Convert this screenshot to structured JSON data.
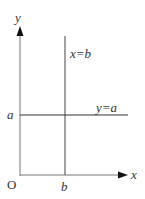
{
  "diagram": {
    "axes": {
      "x_label": "x",
      "y_label": "y",
      "origin_label": "O"
    },
    "lines": [
      {
        "label": "x=b",
        "orientation": "vertical"
      },
      {
        "label": "y=a",
        "orientation": "horizontal"
      }
    ],
    "ticks": {
      "x_tick": "b",
      "y_tick": "a"
    },
    "colors": {
      "axis": "#555555",
      "line": "#333333",
      "text": "#333333"
    }
  }
}
